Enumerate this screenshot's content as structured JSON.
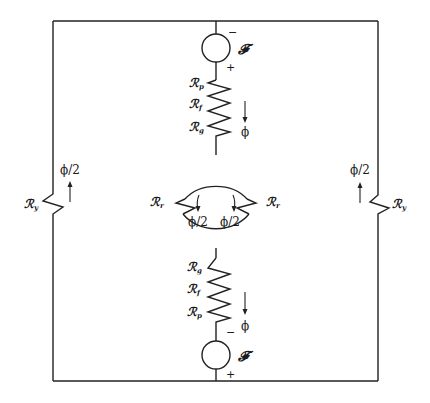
{
  "diagram": {
    "title": "",
    "colors": {
      "line": "#222222",
      "background": "#ffffff"
    },
    "top_source": {
      "symbol": "𝓕",
      "minus": "−",
      "plus": "+"
    },
    "bottom_source": {
      "symbol": "𝓕",
      "minus": "−",
      "plus": "+"
    },
    "upper_branch": {
      "resistors": [
        {
          "base": "ℛ",
          "sub": "p"
        },
        {
          "base": "ℛ",
          "sub": "f"
        },
        {
          "base": "ℛ",
          "sub": "g"
        }
      ],
      "flux_label": "ϕ"
    },
    "lower_branch": {
      "resistors": [
        {
          "base": "ℛ",
          "sub": "g"
        },
        {
          "base": "ℛ",
          "sub": "f"
        },
        {
          "base": "ℛ",
          "sub": "p"
        }
      ],
      "flux_label": "ϕ"
    },
    "rotor": {
      "left": {
        "base": "ℛ",
        "sub": "r",
        "flux": "ϕ/2"
      },
      "right": {
        "base": "ℛ",
        "sub": "r",
        "flux": "ϕ/2"
      }
    },
    "yoke": {
      "left": {
        "base": "ℛ",
        "sub": "y",
        "flux": "ϕ/2"
      },
      "right": {
        "base": "ℛ",
        "sub": "y",
        "flux": "ϕ/2"
      }
    }
  }
}
